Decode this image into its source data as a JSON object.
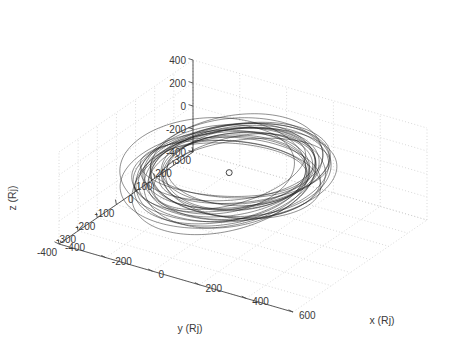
{
  "figure": {
    "kind": "matlab-3d-line-plot",
    "background_color": "#ffffff",
    "line_color": "#1a1a1a",
    "grid_color": "#c8c8c8",
    "axis_color": "#4a4a4a",
    "text_color": "#3a3a3a"
  },
  "chart_data": {
    "type": "line",
    "projection": "3d",
    "title": "",
    "xlabel": "x (Rj)",
    "ylabel": "y (Rj)",
    "zlabel": "z (Rj)",
    "xlim": [
      -400,
      600
    ],
    "ylim": [
      -400,
      300
    ],
    "zlim": [
      -400,
      400
    ],
    "xticks": [
      -400,
      -200,
      0,
      200,
      400,
      600
    ],
    "xticklabels": [
      "-400",
      "-200",
      "0",
      "200",
      "400",
      "600"
    ],
    "yticks": [
      300,
      200,
      100,
      0,
      -100,
      -200,
      -300,
      -400
    ],
    "yticklabels": [
      "300",
      "200",
      "100",
      "0",
      "-100",
      "-200",
      "-300",
      "-400"
    ],
    "zticks": [
      -400,
      -200,
      0,
      200,
      400
    ],
    "zticklabels": [
      "-400",
      "-200",
      "0",
      "200",
      "400"
    ],
    "grid": true,
    "grid_style": "dotted",
    "legend": null,
    "annotations": [
      {
        "name": "central-body-marker",
        "marker": "open-circle",
        "x": 0,
        "y": 0,
        "z": 0,
        "description": "small open circle at origin representing the central body (Jupiter)"
      }
    ],
    "series": [
      {
        "name": "orbit-bundle",
        "description": "many overlapping inclined elliptical orbits traced about the origin",
        "n_orbits": 26,
        "semi_major_axis_range": [
          240,
          330
        ],
        "eccentricity_range": [
          0.02,
          0.2
        ],
        "inclination_deg_range": [
          -26,
          26
        ],
        "node_deg_range": [
          0,
          360
        ],
        "color": "#1a1a1a"
      }
    ]
  },
  "axes": {
    "x_title": "x (Rj)",
    "y_title": "y (Rj)",
    "z_title": "z (Rj)"
  }
}
